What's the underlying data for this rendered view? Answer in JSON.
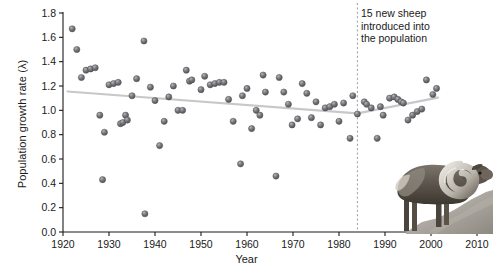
{
  "figure": {
    "annotation": "15 new sheep\nintroduced into\nthe population",
    "annotation_lines": [
      "15 new sheep",
      "introduced into",
      "the population"
    ],
    "photo_caption": "bighorn-ram-standing-on-rock"
  },
  "chart_data": {
    "type": "scatter",
    "title": "",
    "xlabel": "Year",
    "ylabel": "Population growth rate (λ)",
    "xlim": [
      1920,
      2010
    ],
    "ylim": [
      0.0,
      1.8
    ],
    "xticks": [
      1920,
      1930,
      1940,
      1950,
      1960,
      1970,
      1980,
      1990,
      2000,
      2010
    ],
    "yticks": [
      0.0,
      0.2,
      0.4,
      0.6,
      0.8,
      1.0,
      1.2,
      1.4,
      1.6,
      1.8
    ],
    "ytick_labels": [
      "0.0",
      "0.2",
      "0.4",
      "0.6",
      "0.8",
      "1.0",
      "1.2",
      "1.4",
      "1.6",
      "1.8"
    ],
    "xtick_labels": [
      "1920",
      "1930",
      "1940",
      "1950",
      "1960",
      "1970",
      "1980",
      "1990",
      "2000",
      "2010"
    ],
    "grid": false,
    "legend": null,
    "marker_color": "#6e6e73",
    "trend_color": "#c8c8c8",
    "vline_color": "#9a9a9a",
    "points": [
      [
        1922,
        1.67
      ],
      [
        1923,
        1.5
      ],
      [
        1924,
        1.27
      ],
      [
        1925,
        1.33
      ],
      [
        1926,
        1.34
      ],
      [
        1927,
        1.35
      ],
      [
        1928,
        0.96
      ],
      [
        1928.6,
        0.43
      ],
      [
        1929,
        0.82
      ],
      [
        1930,
        1.21
      ],
      [
        1931,
        1.22
      ],
      [
        1932,
        1.23
      ],
      [
        1932.5,
        0.89
      ],
      [
        1933,
        0.9
      ],
      [
        1933.6,
        0.96
      ],
      [
        1934,
        0.92
      ],
      [
        1935,
        1.12
      ],
      [
        1936,
        1.26
      ],
      [
        1937.6,
        1.57
      ],
      [
        1937.8,
        0.15
      ],
      [
        1939,
        1.19
      ],
      [
        1940,
        1.08
      ],
      [
        1941,
        0.71
      ],
      [
        1942,
        0.91
      ],
      [
        1943,
        1.11
      ],
      [
        1944,
        1.2
      ],
      [
        1945,
        1.0
      ],
      [
        1946,
        1.0
      ],
      [
        1946.8,
        1.33
      ],
      [
        1947.5,
        1.24
      ],
      [
        1948,
        1.25
      ],
      [
        1950,
        1.17
      ],
      [
        1950.8,
        1.28
      ],
      [
        1952,
        1.21
      ],
      [
        1953,
        1.22
      ],
      [
        1954,
        1.23
      ],
      [
        1955,
        1.23
      ],
      [
        1956,
        1.09
      ],
      [
        1957,
        0.91
      ],
      [
        1958.6,
        0.56
      ],
      [
        1959,
        1.12
      ],
      [
        1960,
        1.18
      ],
      [
        1961,
        0.85
      ],
      [
        1962,
        1.0
      ],
      [
        1962.8,
        0.96
      ],
      [
        1963.5,
        1.29
      ],
      [
        1964,
        1.15
      ],
      [
        1966.3,
        0.46
      ],
      [
        1967,
        1.27
      ],
      [
        1968,
        1.15
      ],
      [
        1969,
        1.05
      ],
      [
        1969.8,
        0.88
      ],
      [
        1971,
        0.93
      ],
      [
        1972,
        1.22
      ],
      [
        1973,
        1.14
      ],
      [
        1974,
        0.94
      ],
      [
        1975,
        1.07
      ],
      [
        1976,
        0.88
      ],
      [
        1977,
        1.02
      ],
      [
        1978,
        1.03
      ],
      [
        1979,
        1.05
      ],
      [
        1980,
        0.91
      ],
      [
        1981,
        1.06
      ],
      [
        1982.4,
        0.77
      ],
      [
        1983,
        1.12
      ],
      [
        1984,
        0.97
      ],
      [
        1985.5,
        1.07
      ],
      [
        1986,
        1.05
      ],
      [
        1987,
        1.02
      ],
      [
        1988.3,
        0.77
      ],
      [
        1989,
        1.03
      ],
      [
        1989.6,
        0.96
      ],
      [
        1991,
        1.1
      ],
      [
        1992,
        1.11
      ],
      [
        1992.8,
        1.09
      ],
      [
        1993.5,
        1.07
      ],
      [
        1994,
        1.06
      ],
      [
        1995,
        0.92
      ],
      [
        1996,
        0.96
      ],
      [
        1997,
        0.99
      ],
      [
        1998,
        1.01
      ],
      [
        1999,
        1.25
      ],
      [
        2000.4,
        1.13
      ],
      [
        2001.2,
        1.18
      ]
    ],
    "trend_segments": [
      {
        "name": "pre-introduction",
        "x": [
          1921,
          1984
        ],
        "y": [
          1.155,
          0.975
        ]
      },
      {
        "name": "post-introduction",
        "x": [
          1984,
          2001.5
        ],
        "y": [
          0.975,
          1.105
        ]
      }
    ],
    "vline": {
      "x": 1984,
      "style": "dashed",
      "label": "15 new sheep introduced into the population"
    }
  }
}
